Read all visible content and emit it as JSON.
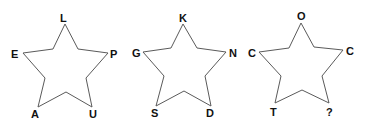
{
  "puzzle": {
    "stars": [
      {
        "id": "star-1",
        "letters": {
          "top": "L",
          "left": "E",
          "right": "P",
          "bottom_left": "A",
          "bottom_right": "U"
        }
      },
      {
        "id": "star-2",
        "letters": {
          "top": "K",
          "left": "G",
          "right": "N",
          "bottom_left": "S",
          "bottom_right": "D"
        }
      },
      {
        "id": "star-3",
        "letters": {
          "top": "O",
          "left": "C",
          "right": "C",
          "bottom_left": "T",
          "bottom_right": "?"
        }
      }
    ]
  },
  "colors": {
    "outline": "#5a5a5a",
    "text": "#111111",
    "background": "#ffffff"
  }
}
